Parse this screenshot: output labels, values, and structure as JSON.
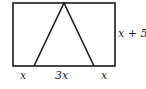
{
  "diagram": {
    "rectangle": {
      "x": 13,
      "y": 3,
      "width": 102,
      "height": 63
    },
    "triangle": {
      "apex": [
        64,
        3
      ],
      "base_left": [
        34,
        66
      ],
      "base_right": [
        94,
        66
      ]
    },
    "stroke_color": "#1a1a1a",
    "labels": {
      "height": "x + 5",
      "bottom_left": "x",
      "bottom_middle": "3x",
      "bottom_right": "x"
    }
  }
}
